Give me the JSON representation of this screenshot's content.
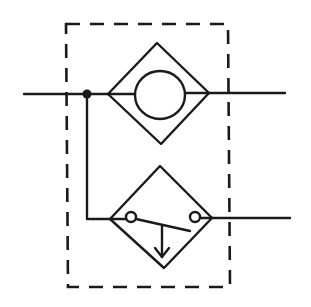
{
  "diagram": {
    "type": "pneumatic-schematic-symbol",
    "colors": {
      "stroke": "#1a1a1a",
      "background": "#ffffff"
    },
    "components": [
      {
        "id": "assembly-boundary",
        "kind": "dashed-enclosure"
      },
      {
        "id": "main-line",
        "kind": "flow-line"
      },
      {
        "id": "junction",
        "kind": "junction-dot"
      },
      {
        "id": "filter",
        "kind": "diamond-with-circle"
      },
      {
        "id": "branch-line",
        "kind": "flow-line"
      },
      {
        "id": "pressure-switch",
        "kind": "diamond-with-switch-contacts-and-arrow"
      },
      {
        "id": "switch-output-line",
        "kind": "flow-line"
      }
    ]
  }
}
